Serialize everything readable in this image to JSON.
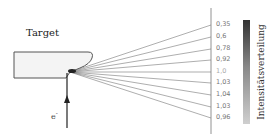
{
  "diagram": {
    "target_label": "Target",
    "electron_label": "e",
    "electron_charge": "-",
    "scale_label": "Intensitätsverteilung",
    "intensity_values": [
      "0,35",
      "0,6",
      "0,78",
      "0,92",
      "1,0",
      "1,03",
      "1,04",
      "1,03",
      "0,96"
    ],
    "colors": {
      "line": "#555555",
      "text": "#222222",
      "value_text": "#777777",
      "bar_top": "#333333",
      "bar_bottom": "#cfcfcf"
    }
  }
}
